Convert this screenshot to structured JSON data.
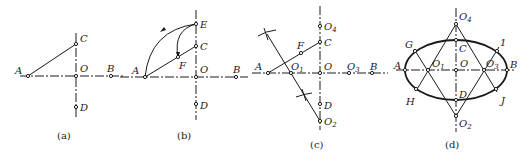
{
  "figure": {
    "panels": [
      {
        "id": "a",
        "caption": "(a)",
        "points": {
          "A": "A",
          "B": "B",
          "C": "C",
          "D": "D",
          "O": "O"
        }
      },
      {
        "id": "b",
        "caption": "(b)",
        "points": {
          "A": "A",
          "B": "B",
          "C": "C",
          "D": "D",
          "O": "O",
          "E": "E",
          "F": "F"
        }
      },
      {
        "id": "c",
        "caption": "(c)",
        "points": {
          "A": "A",
          "B": "B",
          "C": "C",
          "D": "D",
          "O": "O",
          "F": "F",
          "O1": "O",
          "O2": "O",
          "O3": "O",
          "O4": "O"
        },
        "subscripts": {
          "O1": "1",
          "O2": "2",
          "O3": "3",
          "O4": "4"
        }
      },
      {
        "id": "d",
        "caption": "(d)",
        "points": {
          "A": "A",
          "B": "B",
          "C": "C",
          "D": "D",
          "O": "O",
          "G": "G",
          "H": "H",
          "I": "1",
          "J": "J",
          "O1": "O",
          "O2": "O",
          "O3": "O",
          "O4": "O"
        },
        "subscripts": {
          "O1": "1",
          "O2": "2",
          "O3": "3",
          "O4": "4"
        }
      }
    ]
  }
}
